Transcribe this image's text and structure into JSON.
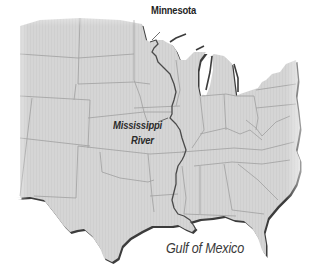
{
  "map": {
    "title": "Mississippi River map of the central United States",
    "labels": {
      "state": "Minnesota",
      "river_line1": "Mississippi",
      "river_line2": "River",
      "water_body": "Gulf of Mexico"
    },
    "colors": {
      "land": "#d4d4d4",
      "border": "#9a9a9a",
      "river": "#4a4a4a",
      "coast_shadow": "#3c3c3c",
      "background": "#ffffff",
      "text": "#2a2a2a"
    },
    "features": [
      "state-borders",
      "mississippi-river",
      "great-lakes",
      "gulf-coast"
    ]
  }
}
